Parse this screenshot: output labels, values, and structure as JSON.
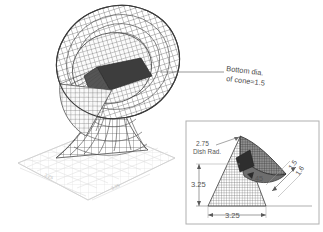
{
  "figure": {
    "title_visible": false,
    "background_color": "#ffffff",
    "main_view": {
      "name": "isometric-wireframe-satellite-dish",
      "description": "Wireframe parabolic dish on hyperboloid pedestal over a ground grid plane",
      "mesh_color": "#555555",
      "ground_grid_color": "#d8d8d8",
      "cone_fill_color": "#3a3a3a",
      "callout": {
        "line1": "Bottom dia.",
        "line2": "of cone=1.5",
        "leader_color": "#6a6a6a"
      },
      "ground_dimensions": [
        {
          "label": "3.25",
          "position": "left-edge"
        },
        {
          "label": "3.25",
          "position": "right-edge"
        }
      ]
    },
    "inset_view": {
      "name": "dimensioned-profile-detail",
      "border_color": "#b0b0b0",
      "background_color": "#ffffff",
      "labels": {
        "dish_radius_value": "2.75",
        "dish_radius_caption": "Dish Rad.",
        "height": "3.25",
        "base_width": "3.25",
        "angle": "45",
        "offset_a": "1.5",
        "offset_b": "1.6"
      }
    }
  }
}
